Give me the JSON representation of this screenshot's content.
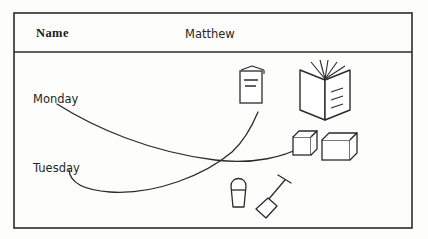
{
  "worksheet": {
    "header": {
      "field_label": "Name",
      "field_value": "Matthew"
    },
    "rows": [
      {
        "label": "Monday"
      },
      {
        "label": "Tuesday"
      }
    ],
    "objects": [
      {
        "name": "closed-booklet",
        "description": "closed booklet with text lines on cover"
      },
      {
        "name": "open-book",
        "description": "open book with pages fanning upward and text lines"
      },
      {
        "name": "small-cube",
        "description": "small 3D cube / box"
      },
      {
        "name": "large-box",
        "description": "wider 3D rectangular box"
      },
      {
        "name": "bucket",
        "description": "bucket / pail with handle"
      },
      {
        "name": "spade",
        "description": "spade / shovel"
      }
    ],
    "connectors": [
      {
        "name": "monday-connector",
        "from": "Monday",
        "to": "small-cube"
      },
      {
        "name": "tuesday-connector",
        "from": "Tuesday",
        "to": "closed-booklet"
      }
    ],
    "colors": {
      "ink": "#1b1b1b",
      "line": "#2b2b2b",
      "paper": "#fdfdfc"
    }
  }
}
